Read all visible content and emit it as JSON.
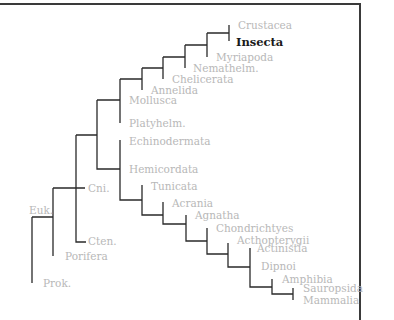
{
  "diagram": {
    "type": "phylogenetic-tree",
    "highlighted_taxon": "Insecta",
    "colors": {
      "line": "#2a2a2a",
      "label": "#b8b8b8",
      "highlight": "#1a1a1a",
      "border": "#3a3a3a"
    },
    "labels": {
      "crustacea": "Crustacea",
      "insecta": "Insecta",
      "myriapoda": "Myriapoda",
      "nemathelm": "Nemathelm.",
      "chelicerata": "Chelicerata",
      "annelida": "Annelida",
      "mollusca": "Mollusca",
      "platyhelm": "Platyhelm.",
      "echinodermata": "Echinodermata",
      "hemicordata": "Hemicordata",
      "tunicata": "Tunicata",
      "acrania": "Acrania",
      "agnatha": "Agnatha",
      "chondrichtyes": "Chondrichtyes",
      "actinopterygii": "Acthopterygii",
      "actinistia": "Actinistia",
      "dipnoi": "Dipnoi",
      "amphibia": "Amphibia",
      "sauropsida": "Sauropsida",
      "mammalia": "Mammalia",
      "cni": "Cni.",
      "cten": "Cten.",
      "porifera": "Porifera",
      "euk": "Euk.",
      "prok": "Prok."
    }
  }
}
